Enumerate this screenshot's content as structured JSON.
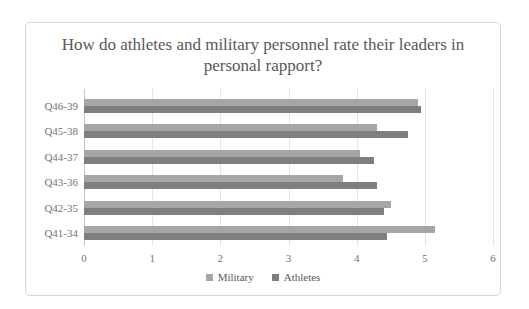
{
  "chart_data": {
    "type": "bar",
    "orientation": "horizontal",
    "title": "How do athletes and military personnel rate their leaders in personal rapport?",
    "categories": [
      "Q46-39",
      "Q45-38",
      "Q44-37",
      "Q43-36",
      "Q42-35",
      "Q41-34"
    ],
    "series": [
      {
        "name": "Military",
        "color": "#a6a6a6",
        "values": [
          4.9,
          4.3,
          4.05,
          3.8,
          4.5,
          5.15
        ]
      },
      {
        "name": "Athletes",
        "color": "#7f7f7f",
        "values": [
          4.95,
          4.75,
          4.25,
          4.3,
          4.4,
          4.45
        ]
      }
    ],
    "xlim": [
      0,
      6
    ],
    "xticks": [
      "0",
      "1",
      "2",
      "3",
      "4",
      "5",
      "6"
    ],
    "grid": true,
    "legend_position": "bottom"
  },
  "colors": {
    "chart_border": "#d6d6d6",
    "gridline": "#e4e4e4",
    "zero_axis_line": "#c4c4c4",
    "title_text": "#595959",
    "tick_text": "#737373"
  }
}
